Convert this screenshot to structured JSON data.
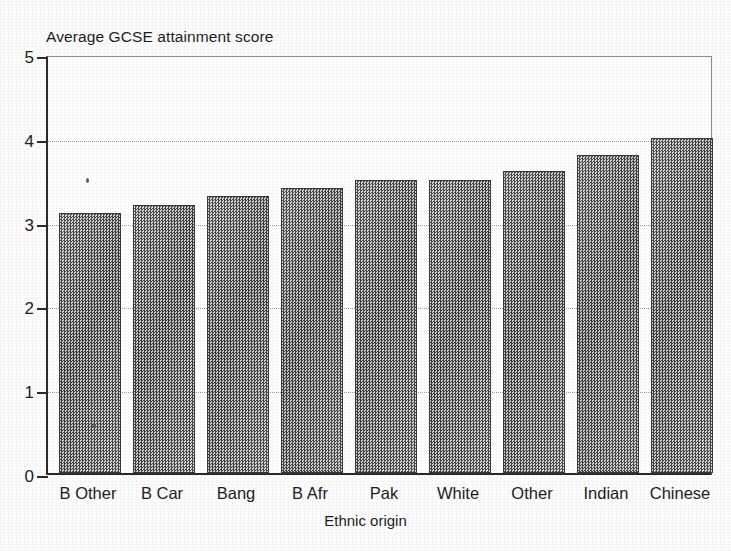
{
  "chart_data": {
    "type": "bar",
    "title": "Average GCSE attainment score",
    "xlabel": "Ethnic origin",
    "ylabel": "",
    "categories": [
      "B Other",
      "B Car",
      "Bang",
      "B Afr",
      "Pak",
      "White",
      "Other",
      "Indian",
      "Chinese"
    ],
    "values": [
      3.1,
      3.2,
      3.3,
      3.4,
      3.5,
      3.5,
      3.6,
      3.8,
      4.0
    ],
    "ylim": [
      0,
      5
    ],
    "ytick_labels": [
      "0",
      "1",
      "2",
      "3",
      "4",
      "5"
    ],
    "ytick_values": [
      0,
      1,
      2,
      3,
      4,
      5
    ],
    "grid": "horizontal-dotted",
    "gridline_values": [
      1,
      2,
      3,
      4
    ],
    "legend": null,
    "legend_position": "none",
    "bar_fill": "#8a8a8a",
    "bar_edge": "#3a3a3a",
    "axis_color": "#2b2b2b",
    "grid_color": "#9b9b9b",
    "background": "#ffffff"
  }
}
